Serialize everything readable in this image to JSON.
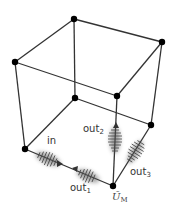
{
  "diagram": {
    "type": "cube-graph",
    "edge_color": "#333333",
    "vertex_color": "#000000",
    "vertices": [
      {
        "id": "top-back",
        "x": 74,
        "y": 19
      },
      {
        "id": "top-right",
        "x": 162,
        "y": 42
      },
      {
        "id": "top-left",
        "x": 15,
        "y": 62
      },
      {
        "id": "top-front",
        "x": 117,
        "y": 96
      },
      {
        "id": "bottom-back",
        "x": 75,
        "y": 98
      },
      {
        "id": "bottom-right",
        "x": 151,
        "y": 125
      },
      {
        "id": "bottom-left",
        "x": 25,
        "y": 149
      },
      {
        "id": "bottom-front",
        "x": 113,
        "y": 186
      }
    ],
    "labels": {
      "in": "in",
      "out1_base": "out",
      "out1_sub": "1",
      "out2_base": "out",
      "out2_sub": "2",
      "out3_base": "out",
      "out3_sub": "3",
      "um_base": "Ũ",
      "um_sub": "M"
    }
  }
}
